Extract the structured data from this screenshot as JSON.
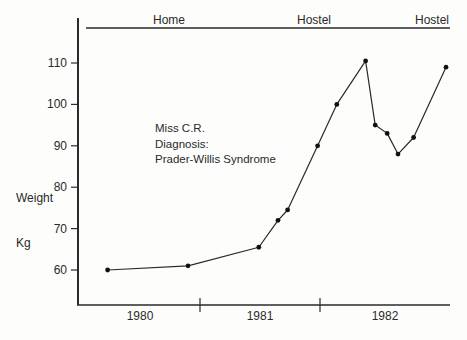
{
  "figure": {
    "background": "#fdfdfc",
    "ink": "#2a2a2a",
    "dot_color": "#111111"
  },
  "y_axis": {
    "title_lines": [
      "Weight",
      "Kg"
    ],
    "ticks": [
      110,
      100,
      90,
      80,
      70,
      60
    ]
  },
  "x_axis": {
    "year_labels": [
      "1980",
      "1981",
      "1982"
    ],
    "divider_years": [
      1981,
      1982
    ]
  },
  "phases": [
    {
      "label": "Home",
      "x": 169
    },
    {
      "label": "Hostel",
      "x": 314
    },
    {
      "label": "Hostel",
      "x": 432
    }
  ],
  "annotation": {
    "line1": "Miss C.R.",
    "line2": "Diagnosis:",
    "line3": "Prader-Willis Syndrome"
  },
  "chart_data": {
    "type": "line",
    "xlabel": "",
    "ylabel": "Weight Kg",
    "ylim": [
      55,
      115
    ],
    "xlim": [
      1979.9,
      1983.1
    ],
    "y_ticks": [
      60,
      70,
      80,
      90,
      100,
      110
    ],
    "x_ticks": [
      1980,
      1981,
      1982
    ],
    "grid": false,
    "legend": "none",
    "residence_phases": [
      "Home",
      "Hostel",
      "Hostel"
    ],
    "series": [
      {
        "name": "Miss C.R. weight (kg)",
        "points": [
          {
            "t": 1980.23,
            "kg": 60
          },
          {
            "t": 1980.9,
            "kg": 61
          },
          {
            "t": 1981.49,
            "kg": 65.5
          },
          {
            "t": 1981.65,
            "kg": 72
          },
          {
            "t": 1981.73,
            "kg": 74.5
          },
          {
            "t": 1981.98,
            "kg": 90
          },
          {
            "t": 1982.14,
            "kg": 100
          },
          {
            "t": 1982.38,
            "kg": 110.5
          },
          {
            "t": 1982.46,
            "kg": 95
          },
          {
            "t": 1982.56,
            "kg": 93
          },
          {
            "t": 1982.65,
            "kg": 88
          },
          {
            "t": 1982.78,
            "kg": 92
          },
          {
            "t": 1983.05,
            "kg": 109
          }
        ]
      }
    ]
  }
}
